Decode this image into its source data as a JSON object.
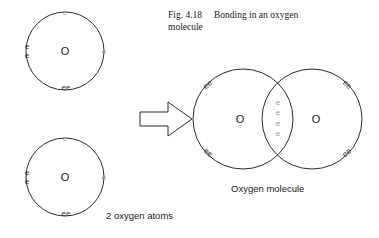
{
  "figure": {
    "caption_number": "Fig. 4.18",
    "caption_line1": "Bonding in an oxygen",
    "caption_line2": "molecule",
    "left_label": "2 oxygen atoms",
    "right_label": "Oxygen molecule",
    "ink_color": "#2b2b2b",
    "electron_color": "#2f2f2f",
    "electron_faint_color": "#9a9a9a"
  },
  "atoms": {
    "top_atom": {
      "nucleus": "O",
      "electrons": {
        "top": "e",
        "left_upper": "e",
        "left_lower": "e",
        "right": "e",
        "bottom_pair": "ee"
      }
    },
    "bottom_atom": {
      "nucleus": "O",
      "electrons": {
        "top": "e",
        "left_upper": "e",
        "left_lower": "e",
        "right": "e",
        "bottom_pair": "ee"
      }
    }
  },
  "molecule": {
    "left_nucleus": "O",
    "right_nucleus": "O",
    "outer_pairs": {
      "top_left": "ee",
      "bottom_left": "ee",
      "top_right": "ee",
      "bottom_right": "ee"
    },
    "shared_electrons": [
      "e",
      "e",
      "e",
      "e"
    ]
  }
}
